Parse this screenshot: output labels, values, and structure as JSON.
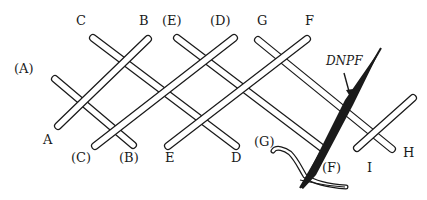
{
  "figure": {
    "labels": {
      "A_paren": "(A)",
      "C_top": "C",
      "B_top": "B",
      "E_paren_top": "(E)",
      "D_paren_top": "(D)",
      "G_top": "G",
      "F_top": "F",
      "A_bottom": "A",
      "C_paren_bottom": "(C)",
      "B_paren_bottom": "(B)",
      "E_bottom": "E",
      "D_bottom": "D",
      "G_paren": "(G)",
      "F_paren": "(F)",
      "I_bottom": "I",
      "H_bottom": "H",
      "needle_annotation": "DNPF"
    },
    "colors": {
      "ink": "#1a1a1a",
      "strand_fill": "#ffffff",
      "background": "#ffffff"
    }
  }
}
